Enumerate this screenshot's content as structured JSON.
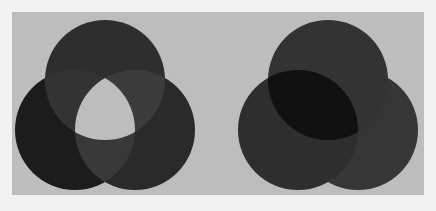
{
  "figure": {
    "background": "#f2f2f2",
    "panel_color": "#bdbdbd",
    "diagrams": [
      {
        "name": "left-venn",
        "mode": "xor-center",
        "circles": [
          {
            "name": "top",
            "cx": 105,
            "cy": 80,
            "r": 60,
            "fill": "#2e2e2e"
          },
          {
            "name": "bottom-left",
            "cx": 75,
            "cy": 130,
            "r": 60,
            "fill": "#1c1c1c"
          },
          {
            "name": "bottom-right",
            "cx": 135,
            "cy": 130,
            "r": 60,
            "fill": "#2a2a2a"
          }
        ],
        "pair_overlap_fill": "#3b3b3b",
        "triple_overlap_fill": "#bdbdbd"
      },
      {
        "name": "right-venn",
        "mode": "multiply",
        "circles": [
          {
            "name": "top",
            "cx": 328,
            "cy": 80,
            "r": 60,
            "fill": "#333333"
          },
          {
            "name": "bottom-left",
            "cx": 298,
            "cy": 130,
            "r": 60,
            "fill": "#2e2e2e"
          },
          {
            "name": "bottom-right",
            "cx": 358,
            "cy": 130,
            "r": 60,
            "fill": "#363636"
          }
        ],
        "top_bottom_left_overlap_fill": "#111111",
        "other_overlap_fill": "#2e2e2e"
      }
    ]
  }
}
